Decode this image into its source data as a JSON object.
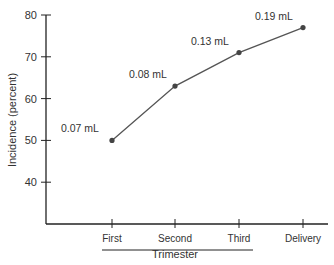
{
  "chart_data": {
    "type": "line",
    "title": "",
    "xlabel": "Trimester",
    "ylabel": "Incidence (percent)",
    "categories": [
      "First",
      "Second",
      "Third",
      "Delivery"
    ],
    "values": [
      50,
      63,
      71,
      77
    ],
    "point_labels": [
      "0.07 mL",
      "0.08 mL",
      "0.13 mL",
      "0.19 mL"
    ],
    "y_ticks": [
      40,
      50,
      60,
      70,
      80
    ],
    "ylim": [
      30,
      80
    ],
    "grid": false,
    "trimester_bracket": [
      "First",
      "Third"
    ]
  },
  "colors": {
    "line": "#555555",
    "point": "#444444",
    "axis": "#222222",
    "text": "#333333"
  }
}
